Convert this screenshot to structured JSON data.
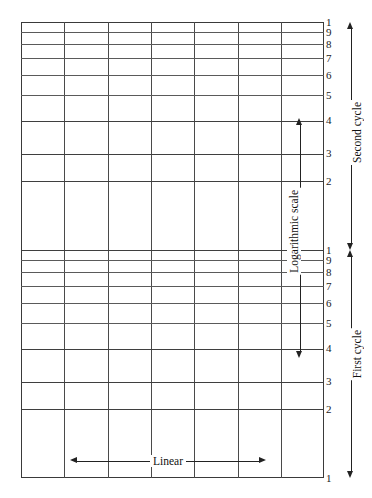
{
  "figure": {
    "kind": "semi-log-graph-paper",
    "background_color": "#ffffff",
    "line_color": "#4a4a4a",
    "border_color": "#3a3a3a",
    "text_color": "#111111"
  },
  "labels": {
    "linear_axis": "Linear",
    "log_axis": "Logarithmic scale",
    "second_cycle": "Second cycle",
    "first_cycle": "First cycle"
  },
  "chart_data": {
    "type": "line",
    "title": "",
    "subtitle": "",
    "xlabel": "Linear",
    "ylabel": "Logarithmic scale",
    "grid": true,
    "legend": "none",
    "series": [],
    "x_axis": {
      "scale": "linear",
      "range": [
        0,
        8
      ],
      "divisions": 7,
      "gridline_x_px": [
        21,
        64.3,
        107.6,
        151.0,
        194.3,
        237.6,
        280.9,
        324
      ],
      "tick_labels": []
    },
    "y_axis": {
      "scale": "log",
      "cycles": 2,
      "range": [
        1,
        100
      ],
      "cycle_labels": [
        "First cycle",
        "Second cycle"
      ],
      "decade_values": [
        1,
        2,
        3,
        4,
        5,
        6,
        7,
        8,
        9,
        10
      ],
      "tick_labels_top_to_bottom": [
        "1",
        "9",
        "8",
        "7",
        "6",
        "5",
        "4",
        "3",
        "2",
        "1",
        "9",
        "8",
        "7",
        "6",
        "5",
        "4",
        "3",
        "2",
        "1"
      ]
    },
    "cycles": [
      {
        "name": "Second cycle",
        "index": 2,
        "top_px": 22,
        "bottom_px": 250,
        "ticks": [
          {
            "value": 10,
            "label": "1",
            "y": 22.0,
            "major": true
          },
          {
            "value": 9,
            "label": "9",
            "y": 32.4,
            "major": false
          },
          {
            "value": 8,
            "label": "8",
            "y": 44.3,
            "major": false
          },
          {
            "value": 7,
            "label": "7",
            "y": 58.4,
            "major": false
          },
          {
            "value": 6,
            "label": "6",
            "y": 75.1,
            "major": false
          },
          {
            "value": 5,
            "label": "5",
            "y": 95.4,
            "major": false
          },
          {
            "value": 4,
            "label": "4",
            "y": 120.8,
            "major": true
          },
          {
            "value": 3,
            "label": "3",
            "y": 153.9,
            "major": true
          },
          {
            "value": 2,
            "label": "2",
            "y": 181.3,
            "major": true
          }
        ]
      },
      {
        "name": "First cycle",
        "index": 1,
        "top_px": 250,
        "bottom_px": 478,
        "ticks": [
          {
            "value": 10,
            "label": "1",
            "y": 250.0,
            "major": true
          },
          {
            "value": 9,
            "label": "9",
            "y": 260.4,
            "major": false
          },
          {
            "value": 8,
            "label": "8",
            "y": 272.3,
            "major": false
          },
          {
            "value": 7,
            "label": "7",
            "y": 286.4,
            "major": false
          },
          {
            "value": 6,
            "label": "6",
            "y": 303.1,
            "major": false
          },
          {
            "value": 5,
            "label": "5",
            "y": 323.4,
            "major": false
          },
          {
            "value": 4,
            "label": "4",
            "y": 348.8,
            "major": true
          },
          {
            "value": 3,
            "label": "3",
            "y": 381.9,
            "major": true
          },
          {
            "value": 2,
            "label": "2",
            "y": 409.3,
            "major": true
          },
          {
            "value": 1,
            "label": "1",
            "y": 478.0,
            "major": true
          }
        ]
      }
    ],
    "annotations": [
      {
        "name": "log-scale-arrow",
        "text": "Logarithmic scale",
        "orientation": "vertical",
        "x": 300,
        "y_from": 118,
        "y_to": 358,
        "arrowheads": "both"
      },
      {
        "name": "linear-arrow",
        "text": "Linear",
        "orientation": "horizontal",
        "y": 461,
        "x_from": 70,
        "x_to": 266,
        "arrowheads": "both"
      },
      {
        "name": "second-cycle-arrow",
        "text": "Second cycle",
        "orientation": "vertical",
        "x": 352,
        "y_from": 22,
        "y_to": 250,
        "arrowheads": "both"
      },
      {
        "name": "first-cycle-arrow",
        "text": "First cycle",
        "orientation": "vertical",
        "x": 352,
        "y_from": 250,
        "y_to": 478,
        "arrowheads": "both"
      }
    ]
  }
}
